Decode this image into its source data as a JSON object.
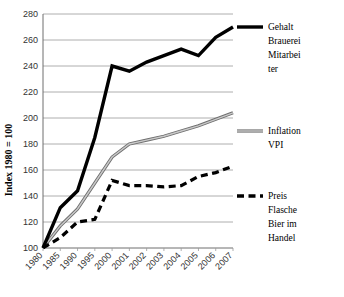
{
  "chart_data": {
    "type": "line",
    "title": "",
    "xlabel": "",
    "ylabel": "Index 1980 = 100",
    "categories": [
      "1980",
      "1985",
      "1990",
      "1995",
      "2000",
      "2001",
      "2002",
      "2003",
      "2004",
      "2005",
      "2006",
      "2007"
    ],
    "ylim": [
      100,
      280
    ],
    "yticks": [
      100,
      120,
      140,
      160,
      180,
      200,
      220,
      240,
      260,
      280
    ],
    "grid": true,
    "legend_position": "right",
    "series": [
      {
        "name": "Gehalt Brauerei Mitarbeiter",
        "legend_label": "Gehalt Brauerei Mitarbei ter",
        "style": "solid-thick",
        "color": "#000000",
        "values": [
          100,
          131,
          144,
          185,
          240,
          236,
          243,
          248,
          253,
          248,
          262,
          270
        ]
      },
      {
        "name": "Inflation VPI",
        "legend_label": "Inflation VPI",
        "style": "solid-double-gray",
        "color": "#8c8c8c",
        "values": [
          100,
          117,
          130,
          150,
          170,
          180,
          183,
          186,
          190,
          194,
          199,
          204
        ]
      },
      {
        "name": "Preis Flasche Bier im Handel",
        "legend_label": "Preis Flasche Bier im Handel",
        "style": "dashed-thick",
        "color": "#000000",
        "values": [
          100,
          108,
          120,
          122,
          152,
          148,
          148,
          147,
          148,
          155,
          158,
          163
        ]
      }
    ]
  },
  "legend": {
    "items": [
      {
        "label_lines": [
          "Gehalt",
          "Brauerei",
          "Mitarbei",
          "ter"
        ],
        "swatch": "solid-black"
      },
      {
        "label_lines": [
          "Inflation",
          "VPI"
        ],
        "swatch": "solid-gray"
      },
      {
        "label_lines": [
          "Preis",
          "Flasche",
          "Bier im",
          "Handel"
        ],
        "swatch": "dashed-black"
      }
    ]
  },
  "axis": {
    "y_label": "Index 1980 = 100",
    "y_ticks": [
      "280",
      "260",
      "240",
      "220",
      "200",
      "180",
      "160",
      "140",
      "120",
      "100"
    ],
    "x_ticks": [
      "1980",
      "1985",
      "1990",
      "1995",
      "2000",
      "2001",
      "2002",
      "2003",
      "2004",
      "2005",
      "2006",
      "2007"
    ]
  },
  "colors": {
    "salary_line": "#000000",
    "inflation_line": "#8c8c8c",
    "beer_price_line": "#000000",
    "gridline": "#9a9a9a",
    "background": "#ffffff"
  }
}
